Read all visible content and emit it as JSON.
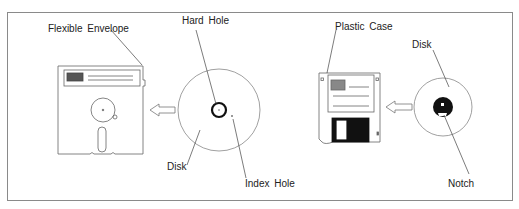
{
  "diagram": {
    "left": {
      "envelope_label": "Flexible  Envelope",
      "center_hole_label": "Hard  Hole",
      "disk_label": "Disk",
      "index_hole_label": "Index  Hole"
    },
    "right": {
      "case_label": "Plastic  Case",
      "disk_label": "Disk",
      "notch_label": "Notch"
    },
    "colors": {
      "line": "#555555",
      "frame": "#8a8a8a",
      "dark_fill": "#111111",
      "label_fill": "#555555"
    }
  }
}
